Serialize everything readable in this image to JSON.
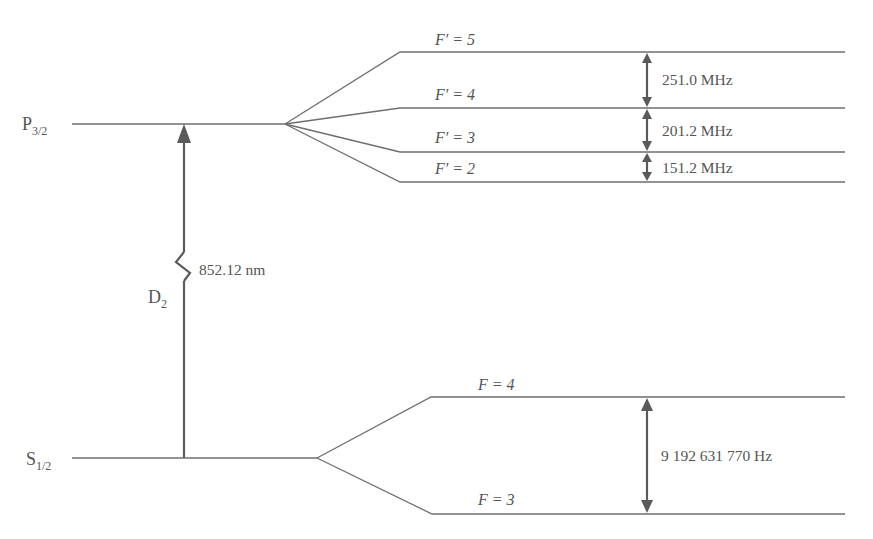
{
  "diagram": {
    "excited_state": {
      "label": "P",
      "subscript": "3/2",
      "sublevels": [
        {
          "label": "F′ = 5"
        },
        {
          "label": "F′ = 4"
        },
        {
          "label": "F′ = 3"
        },
        {
          "label": "F′ = 2"
        }
      ],
      "splittings": [
        {
          "between": "F'=5 and F'=4",
          "value": "251.0 MHz"
        },
        {
          "between": "F'=4 and F'=3",
          "value": "201.2 MHz"
        },
        {
          "between": "F'=3 and F'=2",
          "value": "151.2 MHz"
        }
      ]
    },
    "ground_state": {
      "label": "S",
      "subscript": "1/2",
      "sublevels": [
        {
          "label": "F = 4"
        },
        {
          "label": "F = 3"
        }
      ],
      "splittings": [
        {
          "between": "F=4 and F=3",
          "value": "9 192 631 770 Hz"
        }
      ]
    },
    "transition": {
      "name": "D",
      "name_subscript": "2",
      "wavelength": "852.12 nm"
    },
    "colors": {
      "line": "#6e6e6e",
      "arrow": "#5a5a5a",
      "text": "#555555"
    }
  }
}
